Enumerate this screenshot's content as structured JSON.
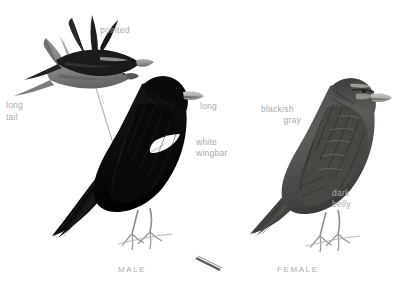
{
  "plate": {
    "title": "Lark Bunting plate",
    "background_color": "#ffffff",
    "label_color": "#a9a9a9",
    "caption_color": "#adadad",
    "bird_black": "#111111",
    "bird_gray": "#6f6f6f",
    "wingbar_white": "#ffffff"
  },
  "annotations": {
    "pointed": "pointed",
    "long_tail_line1": "long",
    "long_tail_line2": "tail",
    "long": "long",
    "white_wingbar_line1": "white",
    "white_wingbar_line2": "wingbar",
    "blackish_gray_line1": "blackish",
    "blackish_gray_line2": "gray",
    "dark_belly_line1": "dark",
    "dark_belly_line2": "belly"
  },
  "captions": {
    "male": "MALE",
    "female": "FEMALE"
  },
  "figures": {
    "flight_pair": "two-birds-in-flight",
    "perched_male": "perched-male-bird",
    "perched_female": "perched-female-bird"
  }
}
